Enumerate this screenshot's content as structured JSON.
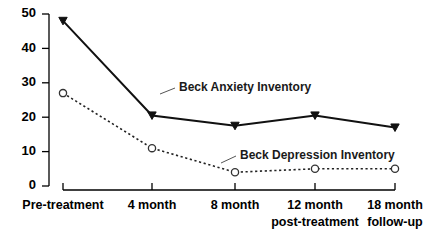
{
  "chart_data": {
    "type": "line",
    "title": "",
    "xlabel": "",
    "ylabel": "",
    "ylim": [
      0,
      50
    ],
    "ytick_values": [
      0,
      10,
      20,
      30,
      40,
      50
    ],
    "ytick_labels": [
      "0",
      "10",
      "20",
      "30",
      "40",
      "50"
    ],
    "grid": false,
    "legend_position": "inline-annotations",
    "categories": [
      "Pre-treatment",
      "4 month",
      "8 month",
      "12 month\npost-treatment",
      "18 month\nfollow-up"
    ],
    "category_lines": [
      [
        "Pre-treatment"
      ],
      [
        "4 month"
      ],
      [
        "8 month"
      ],
      [
        "12 month",
        "post-treatment"
      ],
      [
        "18 month",
        "follow-up"
      ]
    ],
    "series": [
      {
        "name": "Beck Anxiety Inventory",
        "values": [
          48,
          20.5,
          17.5,
          20.5,
          17
        ],
        "marker": "filled-triangle",
        "line_style": "solid",
        "color": "#111111"
      },
      {
        "name": "Beck Depression Inventory",
        "values": [
          27,
          11,
          4,
          5,
          5
        ],
        "marker": "open-circle",
        "line_style": "dotted",
        "color": "#222222"
      }
    ],
    "annotations": [
      {
        "text": "Beck Anxiety Inventory",
        "x": 0.52,
        "y": 26.0
      },
      {
        "text": "Beck Depression Inventory",
        "x": 1.52,
        "y": 9.2
      }
    ]
  },
  "axes": {
    "y_axis_name": "y-axis",
    "x_axis_name": "x-axis"
  }
}
